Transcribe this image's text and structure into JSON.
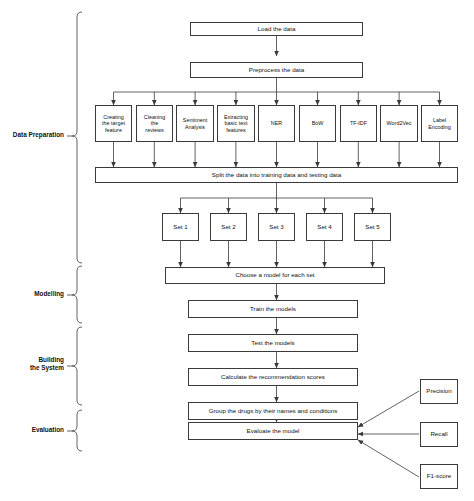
{
  "diagram": {
    "background_color": "#ffffff",
    "stroke_color": "#3a3a3a",
    "text_color": "#111111"
  },
  "phases": [
    {
      "id": "data-preparation",
      "label": "Data Preparation"
    },
    {
      "id": "modelling",
      "label": "Modelling"
    },
    {
      "id": "building-the-system",
      "label": "Building\nthe System"
    },
    {
      "id": "evaluation",
      "label": "Evaluation"
    }
  ],
  "nodes": {
    "load": "Load the data",
    "preprocess": "Preprocess the data",
    "split": "Split the data into training data and testing data",
    "choose_model": "Choose a model for each set",
    "train": "Train the models",
    "test": "Test the models",
    "calculate": "Calculate the recommendation scores",
    "group": "Group the drugs by their names and conditions",
    "evaluate": "Evaluate the model"
  },
  "feature_steps": [
    "Creating\nthe target\nfeature",
    "Cleaning\nthe\nreviews",
    "Sentiment\nAnalysis",
    "Extracting\nbasic text\nfeatures",
    "NER",
    "BoW",
    "TF-IDF",
    "Word2Vec",
    "Label\nEncoding"
  ],
  "sets": [
    "Set 1",
    "Set 2",
    "Set 3",
    "Set 4",
    "Set 5"
  ],
  "metrics": [
    "Precision",
    "Recall",
    "F1-score"
  ]
}
